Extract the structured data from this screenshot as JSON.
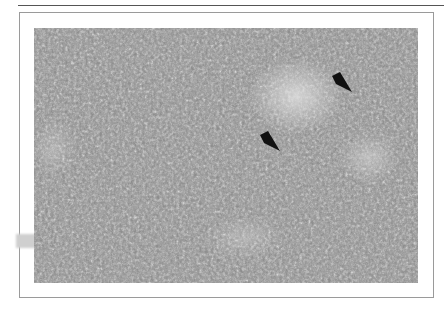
{
  "figure": {
    "type": "histology-micrograph",
    "stain": "grayscale",
    "annotations": [
      {
        "kind": "arrow",
        "direction": "down-right",
        "x": 342,
        "y": 81
      },
      {
        "kind": "arrow",
        "direction": "down-right",
        "x": 270,
        "y": 140
      }
    ]
  },
  "colors": {
    "frame": "#9a9a9a",
    "rule": "#555555",
    "arrow": "#111111"
  }
}
